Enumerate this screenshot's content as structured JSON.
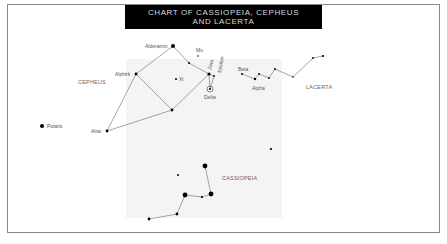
{
  "title": {
    "line1": "CHART OF CASSIOPEIA, CEPHEUS",
    "line2": "AND LACERTA"
  },
  "colors": {
    "title_bg": "#000000",
    "title_text": "#d8d8d8",
    "frame": "#8a8a8a",
    "shade": "#f4f4f4",
    "star": "#000000",
    "line": "#555555"
  },
  "constellations": {
    "cepheus": {
      "label": "CEPHEUS"
    },
    "cassiopeia": {
      "label": "CASSIOPEIA"
    },
    "lacerta": {
      "label": "LACERTA"
    }
  },
  "stars": {
    "polaris": "Polaris",
    "alrai": "Alrai",
    "alphirk": "Alphirk",
    "alderamin": "Alderamin",
    "xi": "Xi",
    "mu": "Mu",
    "zeta": "Zeta",
    "epsilon": "Epsilon",
    "delta": "Delta",
    "beta": "Beta",
    "alpha": "Alpha"
  }
}
